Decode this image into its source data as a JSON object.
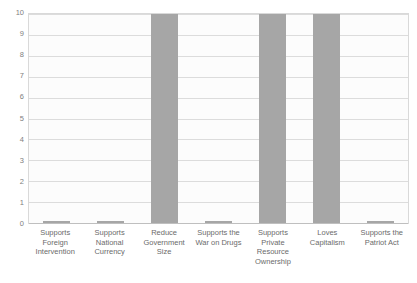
{
  "chart_data": {
    "type": "bar",
    "title": "",
    "xlabel": "",
    "ylabel": "",
    "ylim": [
      0,
      10
    ],
    "ytick_labels": [
      "10",
      "9",
      "8",
      "7",
      "6",
      "5",
      "4",
      "3",
      "2",
      "1",
      "0"
    ],
    "yticks": [
      10,
      9,
      8,
      7,
      6,
      5,
      4,
      3,
      2,
      1,
      0
    ],
    "grid": true,
    "legend": false,
    "legend_position": "none",
    "bar_color": "#a6a6a6",
    "plot_background": "#fcfcfc",
    "gridline_color": "#d9d9d9",
    "categories": [
      "Supports Foreign Intervention",
      "Supports National Currency",
      "Reduce Government Size",
      "Supports the War on Drugs",
      "Supports Private Resource Ownership",
      "Loves Capitalism",
      "Supports the Patriot Act"
    ],
    "values": [
      0,
      0,
      10,
      0,
      10,
      10,
      0
    ]
  }
}
